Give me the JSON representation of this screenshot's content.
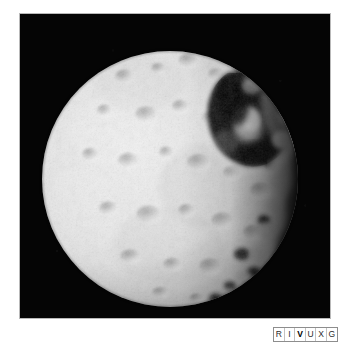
{
  "figure": {
    "kind": "astronomical-photograph",
    "background_color": "#ffffff",
    "photo_background_color": "#000000",
    "photo_border_color": "#b9b9b9",
    "surface_color": "#e8e8e8",
    "shadow_color": "#000000"
  },
  "band_badge": {
    "name": "RIVUXG spectral band indicator",
    "active_band": "V",
    "active_band_name": "Visible",
    "border_color": "#8d8d8d",
    "text_color": "#2b2b2b",
    "active_text_color": "#000000",
    "bands": [
      {
        "letter": "R",
        "name": "Radio",
        "active": false
      },
      {
        "letter": "I",
        "name": "Infrared",
        "active": false
      },
      {
        "letter": "V",
        "name": "Visible",
        "active": true
      },
      {
        "letter": "U",
        "name": "Ultraviolet",
        "active": false
      },
      {
        "letter": "X",
        "name": "X-ray",
        "active": false
      },
      {
        "letter": "G",
        "name": "Gamma ray",
        "active": false
      }
    ]
  }
}
